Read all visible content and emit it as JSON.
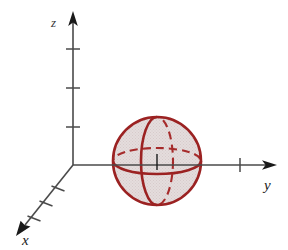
{
  "figure": {
    "title": "",
    "background_color": "#ffffff",
    "width": 288,
    "height": 250
  },
  "axes": {
    "origin": {
      "x": 73,
      "y": 165
    },
    "color": "#4a4a4a",
    "label_color": "#1a1a1a",
    "x_axis": {
      "label": "x",
      "label_pos": {
        "x": 26,
        "y": 243
      },
      "direction": "down-left",
      "start": {
        "x": 73,
        "y": 165
      },
      "end": {
        "x": 20,
        "y": 231
      },
      "arrow": true,
      "tick_count": 3
    },
    "y_axis": {
      "label": "y",
      "label_pos": {
        "x": 268,
        "y": 189
      },
      "direction": "right",
      "start": {
        "x": 73,
        "y": 165
      },
      "end": {
        "x": 276,
        "y": 165
      },
      "arrow": true,
      "tick_count": 1,
      "tick_positions": [
        240
      ]
    },
    "z_axis": {
      "label": "z",
      "label_pos": {
        "x": 55,
        "y": 28
      },
      "direction": "up",
      "start": {
        "x": 73,
        "y": 165
      },
      "end": {
        "x": 73,
        "y": 14
      },
      "arrow": true,
      "tick_count": 3,
      "tick_positions": [
        49,
        88,
        127
      ]
    }
  },
  "sphere": {
    "name": "sphere",
    "center": {
      "x": 157,
      "y": 161
    },
    "radius": 45,
    "outline_color": "#9b2222",
    "fill_color": "#ded3d3",
    "fill_opacity": 0.55,
    "stroke_width": 2.4,
    "great_circles": [
      {
        "name": "outline-circle",
        "style": "solid"
      },
      {
        "name": "equator-front",
        "style": "solid"
      },
      {
        "name": "equator-back",
        "style": "dashed"
      },
      {
        "name": "meridian-front",
        "style": "solid"
      },
      {
        "name": "meridian-back",
        "style": "dashed"
      }
    ],
    "center_tick": {
      "x": 157,
      "y": 161,
      "color": "#1a1a1a"
    }
  }
}
